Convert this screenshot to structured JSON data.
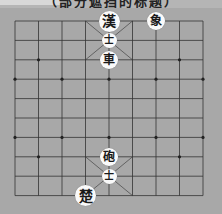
{
  "window": {
    "caption": "（部分遮挡的标题）"
  },
  "board": {
    "type": "xiangqi",
    "columns": 9,
    "rows": 10,
    "origin_px": [
      15,
      21
    ],
    "cell_w": 23.5,
    "cell_h": 19.4,
    "line_color": "#333333",
    "background_color": "#a8a8a8",
    "markers": [
      {
        "col": 1,
        "row": 2
      },
      {
        "col": 7,
        "row": 2
      },
      {
        "col": 0,
        "row": 3
      },
      {
        "col": 2,
        "row": 3
      },
      {
        "col": 4,
        "row": 3
      },
      {
        "col": 6,
        "row": 3
      },
      {
        "col": 8,
        "row": 3
      },
      {
        "col": 0,
        "row": 6
      },
      {
        "col": 2,
        "row": 6
      },
      {
        "col": 4,
        "row": 6
      },
      {
        "col": 6,
        "row": 6
      },
      {
        "col": 8,
        "row": 6
      },
      {
        "col": 1,
        "row": 7
      },
      {
        "col": 7,
        "row": 7
      }
    ]
  },
  "pieces": [
    {
      "id": "han-general",
      "char": "漢",
      "side": "top",
      "col": 4,
      "row": 0,
      "size": "big"
    },
    {
      "id": "top-elephant",
      "char": "象",
      "side": "top",
      "col": 6,
      "row": 0,
      "size": "normal"
    },
    {
      "id": "top-advisor",
      "char": "士",
      "side": "top",
      "col": 4,
      "row": 1,
      "size": "small"
    },
    {
      "id": "top-chariot",
      "char": "車",
      "side": "top",
      "col": 4,
      "row": 2,
      "size": "normal"
    },
    {
      "id": "bottom-cannon",
      "char": "砲",
      "side": "bottom",
      "col": 4,
      "row": 7,
      "size": "normal"
    },
    {
      "id": "bottom-advisor",
      "char": "士",
      "side": "bottom",
      "col": 4,
      "row": 8,
      "size": "small"
    },
    {
      "id": "chu-general",
      "char": "楚",
      "side": "bottom",
      "col": 3,
      "row": 9,
      "size": "big"
    }
  ]
}
